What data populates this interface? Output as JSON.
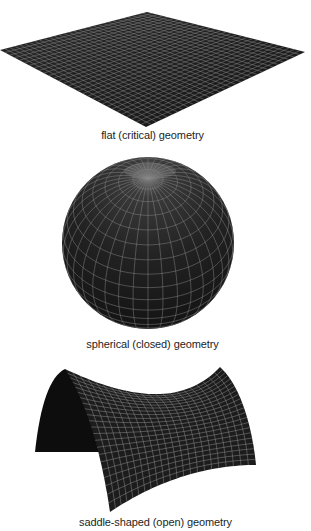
{
  "figure": {
    "panels": [
      {
        "id": "flat",
        "shape": "flat-plane",
        "caption": "flat (critical) geometry",
        "grid_divisions": 30,
        "vertices": {
          "top": [
            147,
            12
          ],
          "right": [
            305,
            52
          ],
          "bottom": [
            146,
            127
          ],
          "left": [
            0,
            50
          ]
        }
      },
      {
        "id": "sphere",
        "shape": "sphere",
        "caption": "spherical (closed) geometry",
        "center": [
          148,
          243
        ],
        "radius": 86,
        "latitude_lines": 18,
        "longitude_lines": 36
      },
      {
        "id": "saddle",
        "shape": "saddle",
        "caption": "saddle-shaped (open) geometry",
        "grid_divisions": 22
      }
    ],
    "colors": {
      "surface": "#1c1c1c",
      "surface_shadow": "#0d0d0d",
      "grid": "#8c8c8c",
      "caption": "#1e1e1e",
      "background": "#ffffff"
    }
  }
}
